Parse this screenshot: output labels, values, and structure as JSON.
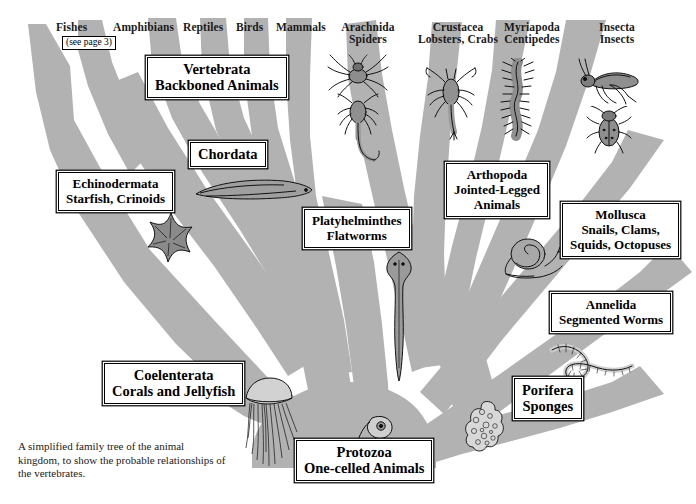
{
  "figure": {
    "caption": "A simplified family tree of the animal kingdom, to show the probable relationships of the vertebrates.",
    "tree_color": "#b2b2b2",
    "background": "#ffffff",
    "ink": "#000000"
  },
  "vertebrate_tips": [
    {
      "label": "Fishes"
    },
    {
      "label": "Amphibians"
    },
    {
      "label": "Reptiles"
    },
    {
      "label": "Birds"
    },
    {
      "label": "Mammals"
    }
  ],
  "see_page_note": "(see page 3)",
  "arthropod_tips": [
    {
      "name": "Arachnida",
      "common": "Spiders"
    },
    {
      "name": "Crustacea",
      "common": "Lobsters, Crabs"
    },
    {
      "name": "Myriapoda",
      "common": "Centipedes"
    },
    {
      "name": "Insecta",
      "common": "Insects"
    }
  ],
  "taxa": [
    {
      "id": "vertebrata",
      "lines": [
        "Vertebrata",
        "Backboned Animals"
      ]
    },
    {
      "id": "chordata",
      "lines": [
        "Chordata"
      ]
    },
    {
      "id": "echinodermata",
      "lines": [
        "Echinodermata",
        "Starfish, Crinoids"
      ]
    },
    {
      "id": "platyhelminthes",
      "lines": [
        "Platyhelminthes",
        "Flatworms"
      ]
    },
    {
      "id": "arthopoda",
      "lines": [
        "Arthopoda",
        "Jointed-Legged",
        "Animals"
      ]
    },
    {
      "id": "mollusca",
      "lines": [
        "Mollusca",
        "Snails, Clams,",
        "Squids, Octopuses"
      ]
    },
    {
      "id": "annelida",
      "lines": [
        "Annelida",
        "Segmented Worms"
      ]
    },
    {
      "id": "coelenterata",
      "lines": [
        "Coelenterata",
        "Corals and Jellyfish"
      ]
    },
    {
      "id": "porifera",
      "lines": [
        "Porifera",
        "Sponges"
      ]
    },
    {
      "id": "protozoa",
      "lines": [
        "Protozoa",
        "One-celled Animals"
      ]
    }
  ],
  "illustrations": [
    {
      "id": "spider-illustration",
      "name": "spider"
    },
    {
      "id": "scorpion-illustration",
      "name": "scorpion"
    },
    {
      "id": "crustacean-illustration",
      "name": "lobster"
    },
    {
      "id": "centipede-illustration",
      "name": "centipede"
    },
    {
      "id": "grasshopper-illustration",
      "name": "grasshopper"
    },
    {
      "id": "beetle-illustration",
      "name": "beetle"
    },
    {
      "id": "lancelet-illustration",
      "name": "lancelet"
    },
    {
      "id": "starfish-illustration",
      "name": "starfish"
    },
    {
      "id": "flatworm-illustration",
      "name": "flatworm"
    },
    {
      "id": "snail-illustration",
      "name": "snail"
    },
    {
      "id": "earthworm-illustration",
      "name": "earthworm"
    },
    {
      "id": "jellyfish-illustration",
      "name": "jellyfish"
    },
    {
      "id": "sponge-illustration",
      "name": "sponge"
    },
    {
      "id": "protozoan-illustration",
      "name": "protozoan"
    }
  ]
}
